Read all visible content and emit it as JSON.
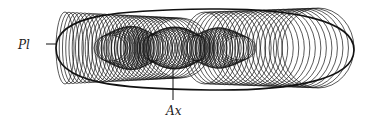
{
  "figure": {
    "labels": {
      "pl": "Pl",
      "ax": "Ax"
    },
    "stroke_color": "#111111",
    "background": "#ffffff",
    "left_loops": {
      "count": 30,
      "x_start": 56,
      "x_end": 150,
      "rx_start": 9,
      "rx_end": 30,
      "ry_start": 36,
      "ry_end": 30
    },
    "center_loops": {
      "count": 60,
      "x_start": 110,
      "x_end": 240,
      "rx": 16,
      "ry_start": 22,
      "ry_end": 20
    },
    "right_loops": {
      "count": 24,
      "x_start": 205,
      "x_end": 318,
      "rx_start": 22,
      "rx_end": 36,
      "ry_start": 36,
      "ry_end": 40
    },
    "center_y": 48
  }
}
